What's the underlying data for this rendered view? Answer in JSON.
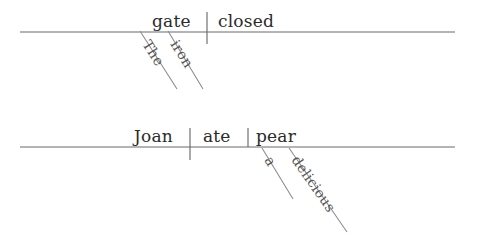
{
  "figure": {
    "kind": "reed-kellogg-sentence-diagrams",
    "background_color": "#ffffff",
    "word_color": "#2b2b2b",
    "modifier_color": "#555555",
    "line_color": "#6b6b70",
    "slant_color": "#8a8a8f"
  },
  "diagrams": [
    {
      "id": "diagram-1",
      "sentence": "The iron gate closed.",
      "baseline": {
        "x1": 20,
        "y": 32,
        "x2": 455
      },
      "subject": {
        "label": "gate",
        "x": 152,
        "y": 27
      },
      "predicate": {
        "label": "closed",
        "x": 218,
        "y": 27
      },
      "dividers": [
        {
          "name": "subject-predicate-divider",
          "x": 207,
          "y1": 12,
          "y2": 44
        }
      ],
      "modifiers": [
        {
          "label": "The",
          "attaches_to": "gate",
          "line": {
            "x1": 140,
            "y1": 31,
            "x2": 177,
            "y2": 89
          },
          "text_x": 142,
          "text_y": 44,
          "rotate": 58
        },
        {
          "label": "iron",
          "attaches_to": "gate",
          "line": {
            "x1": 168,
            "y1": 31,
            "x2": 203,
            "y2": 89
          },
          "text_x": 170,
          "text_y": 44,
          "rotate": 58
        }
      ]
    },
    {
      "id": "diagram-2",
      "sentence": "Joan ate a delicious pear.",
      "baseline": {
        "x1": 20,
        "y": 147,
        "x2": 455
      },
      "subject": {
        "label": "Joan",
        "x": 134,
        "y": 142
      },
      "predicate": {
        "label": "ate",
        "x": 203,
        "y": 142
      },
      "direct_object": {
        "label": "pear",
        "x": 256,
        "y": 142
      },
      "dividers": [
        {
          "name": "subject-predicate-divider",
          "x": 190,
          "y1": 128,
          "y2": 160
        },
        {
          "name": "verb-object-divider",
          "x": 248,
          "y1": 128,
          "y2": 147
        }
      ],
      "modifiers": [
        {
          "label": "a",
          "attaches_to": "pear",
          "line": {
            "x1": 262,
            "y1": 148,
            "x2": 293,
            "y2": 199
          },
          "text_x": 264,
          "text_y": 160,
          "rotate": 59
        },
        {
          "label": "delicious",
          "attaches_to": "pear",
          "line": {
            "x1": 289,
            "y1": 148,
            "x2": 347,
            "y2": 232
          },
          "text_x": 291,
          "text_y": 160,
          "rotate": 55
        }
      ]
    }
  ]
}
